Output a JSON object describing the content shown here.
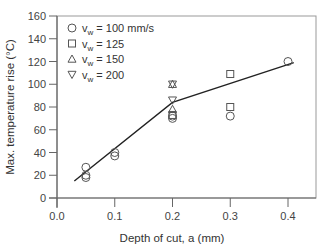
{
  "chart_data": {
    "type": "scatter",
    "title": "",
    "xlabel": "Depth of cut, a (mm)",
    "ylabel": "Max. temperature rise (°C)",
    "xlim": [
      0.0,
      0.42
    ],
    "ylim": [
      0,
      160
    ],
    "xticks": [
      0.0,
      0.1,
      0.2,
      0.3,
      0.4
    ],
    "xtick_labels": [
      "0.0",
      "0.1",
      "0.2",
      "0.3",
      "0.4"
    ],
    "yticks": [
      0,
      20,
      40,
      60,
      80,
      100,
      120,
      140,
      160
    ],
    "ytick_labels": [
      "0",
      "20",
      "40",
      "60",
      "80",
      "100",
      "120",
      "140",
      "160"
    ],
    "grid": false,
    "legend_position": "upper-left",
    "series": [
      {
        "name": "v_w = 100 mm/s",
        "marker": "circle",
        "points": [
          [
            0.05,
            27
          ],
          [
            0.05,
            20
          ],
          [
            0.05,
            18
          ],
          [
            0.1,
            40
          ],
          [
            0.1,
            37
          ],
          [
            0.2,
            72
          ],
          [
            0.2,
            70
          ],
          [
            0.3,
            72
          ],
          [
            0.4,
            120
          ]
        ]
      },
      {
        "name": "v_w = 125",
        "marker": "square",
        "points": [
          [
            0.2,
            73
          ],
          [
            0.3,
            109
          ],
          [
            0.3,
            80
          ]
        ]
      },
      {
        "name": "v_w = 150",
        "marker": "triangle-up",
        "points": [
          [
            0.2,
            100
          ],
          [
            0.2,
            78
          ]
        ]
      },
      {
        "name": "v_w = 200",
        "marker": "triangle-down",
        "points": [
          [
            0.2,
            100
          ],
          [
            0.2,
            86
          ]
        ]
      }
    ],
    "trend_line": {
      "points": [
        [
          0.03,
          15
        ],
        [
          0.2,
          84
        ],
        [
          0.41,
          119
        ]
      ]
    }
  },
  "legend": {
    "items": [
      {
        "symbol": "○",
        "prefix": "v",
        "sub": "w",
        "text": " = 100 mm/s"
      },
      {
        "symbol": "□",
        "prefix": "v",
        "sub": "w",
        "text": " = 125"
      },
      {
        "symbol": "△",
        "prefix": "v",
        "sub": "w",
        "text": " = 150"
      },
      {
        "symbol": "▽",
        "prefix": "v",
        "sub": "w",
        "text": " = 200"
      }
    ]
  }
}
